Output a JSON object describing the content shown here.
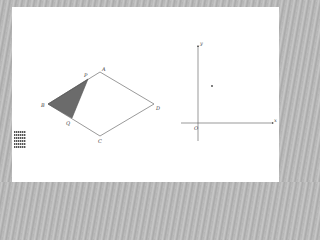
{
  "figure": {
    "rhombus": {
      "vertices": {
        "A": {
          "label": "A",
          "x": 100,
          "y": 72
        },
        "B": {
          "label": "B",
          "x": 48,
          "y": 104
        },
        "C": {
          "label": "C",
          "x": 100,
          "y": 136
        },
        "D": {
          "label": "D",
          "x": 154,
          "y": 104
        }
      },
      "points_on_sides": {
        "P": {
          "label": "P",
          "x": 88,
          "y": 79
        },
        "Q": {
          "label": "Q",
          "x": 72,
          "y": 118
        }
      },
      "shaded_triangle": [
        "B",
        "P",
        "Q"
      ],
      "shade_color": "#6b6b6b",
      "stroke_color": "#555555"
    },
    "coordinate_system": {
      "origin_label": "O",
      "x_axis_label": "x",
      "y_axis_label": "y",
      "point": {
        "x": 212,
        "y": 86
      }
    },
    "legend_lines": [
      "",
      "",
      "",
      "",
      "",
      ""
    ]
  }
}
